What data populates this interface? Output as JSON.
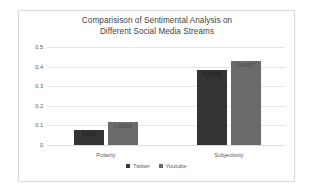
{
  "chart_data": {
    "type": "bar",
    "title": "Comparisison of Sentimental Analysis on Different Social Media Streams",
    "title_line1": "Comparisison of Sentimental Analysis on",
    "title_line2": "Different Social Media Streams",
    "categories": [
      "Polarity",
      "Subjectivity"
    ],
    "series": [
      {
        "name": "Twitter",
        "color": "#333333",
        "values": [
          0.0766,
          0.3821
        ],
        "labels": [
          "0.0766",
          "0.382148"
        ]
      },
      {
        "name": "Youtube",
        "color": "#6a6a6a",
        "values": [
          0.115288,
          0.430627
        ],
        "labels": [
          "0.115288",
          "0.430627"
        ]
      }
    ],
    "xlabel": "",
    "ylabel": "",
    "ylim": [
      0,
      0.5
    ],
    "yticks": [
      "0.5",
      "0.4",
      "0.3",
      "0.2",
      "0.1",
      "0"
    ],
    "ytick_values": [
      0.5,
      0.4,
      0.3,
      0.2,
      0.1,
      0
    ],
    "grid": true,
    "legend_position": "bottom"
  }
}
